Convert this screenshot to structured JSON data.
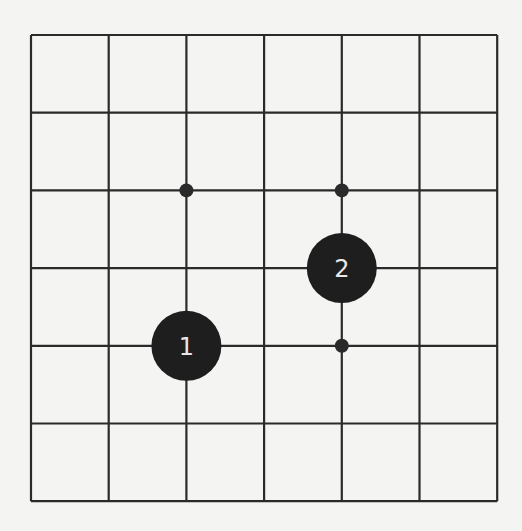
{
  "board": {
    "size": 7,
    "origin_x": 31,
    "origin_y": 35,
    "cell": 77.7,
    "line_color": "#2a2a2a",
    "background": "#f4f4f2"
  },
  "star_points": [
    {
      "col": 2,
      "row": 2
    },
    {
      "col": 4,
      "row": 2
    },
    {
      "col": 4,
      "row": 4
    }
  ],
  "stones": [
    {
      "col": 2,
      "row": 4,
      "color": "black",
      "label": "1"
    },
    {
      "col": 4,
      "row": 3,
      "color": "black",
      "label": "2"
    }
  ],
  "stone_colors": {
    "black": "#1e1e1e"
  }
}
